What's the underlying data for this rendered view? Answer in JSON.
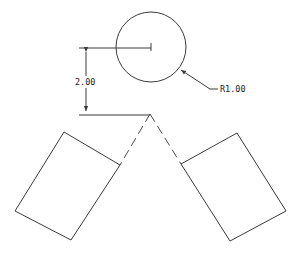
{
  "diagram": {
    "type": "cad-drawing",
    "stroke_color": "#3a3a3a",
    "background": "#ffffff",
    "dimensions": {
      "vertical": {
        "label": "2.00"
      },
      "radius": {
        "label": "R1.00"
      }
    },
    "circle": {
      "cx": 151,
      "cy": 47,
      "r": 35
    },
    "apex": {
      "x": 150,
      "y": 114
    },
    "rectangles": [
      {
        "name": "left-block",
        "points": "64,132 120,165 71,240 15,211"
      },
      {
        "name": "right-block",
        "points": "181,164 237,133 286,211 230,241"
      }
    ]
  }
}
